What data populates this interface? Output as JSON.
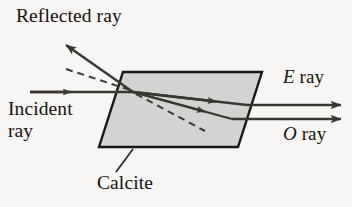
{
  "figure": {
    "width": 352,
    "height": 207,
    "background_color": "#f7f6f4"
  },
  "labels": {
    "reflected_ray": "Reflected ray",
    "incident_line1": "Incident",
    "incident_line2": "ray",
    "calcite": "Calcite",
    "e_ray_symbol": "E",
    "e_ray_word": " ray",
    "o_ray_symbol": "O",
    "o_ray_word": " ray"
  },
  "colors": {
    "ink": "#17120f",
    "crystal_fill": "#d4d3d1",
    "crystal_stroke": "#1a1714",
    "ray_stroke": "#3a3733",
    "dashed_stroke": "#3d3a36"
  },
  "crystal": {
    "shape": "parallelogram",
    "points": "123,72 262,72 238,147 99,147",
    "fill": "#d4d3d1",
    "stroke_width": 2.4
  },
  "rays": {
    "incident": {
      "name": "incident-ray",
      "x1": 30,
      "y1": 92,
      "x2": 133,
      "y2": 92,
      "arrow_at": 0.38
    },
    "reflected": {
      "name": "reflected-ray",
      "x1": 133,
      "y1": 92,
      "x2": 64,
      "y2": 43
    },
    "normal_dashed": {
      "name": "normal-dashed-line",
      "x1": 66,
      "y1": 70,
      "x2": 131,
      "y2": 91
    },
    "internal_dashed": {
      "name": "internal-dashed-line",
      "x1": 134,
      "y1": 93,
      "x2": 204,
      "y2": 131
    },
    "internal_e": {
      "name": "internal-e-ray",
      "x1": 133,
      "y1": 92,
      "x2": 247,
      "y2": 105,
      "arrow_at": 0.72
    },
    "internal_o": {
      "name": "internal-o-ray",
      "x1": 133,
      "y1": 92,
      "x2": 232,
      "y2": 119,
      "arrow_at": 0.74
    },
    "exit_e": {
      "name": "exit-e-ray",
      "x1": 247,
      "y1": 105,
      "x2": 346,
      "y2": 105
    },
    "exit_o": {
      "name": "exit-o-ray",
      "x1": 232,
      "y1": 119,
      "x2": 346,
      "y2": 119
    },
    "calcite_leader": {
      "name": "calcite-leader-line",
      "x1": 132,
      "y1": 148,
      "x2": 115,
      "y2": 172
    }
  }
}
